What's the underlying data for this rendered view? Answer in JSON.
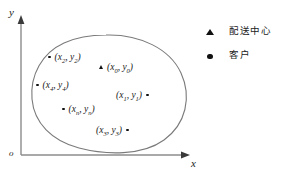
{
  "diagram": {
    "axes": {
      "y_label": "y",
      "x_label": "x",
      "origin_label": "o",
      "axis_color": "#8c8c8c"
    },
    "region": {
      "name": "service-area-boundary",
      "stroke_color": "#7a7a7a"
    },
    "points": [
      {
        "id": "point-x2-y2",
        "marker": "dot",
        "marker_side": "left",
        "var_x": "x",
        "sub_x": "2",
        "var_y": "y",
        "sub_y": "2",
        "left": 48,
        "top": 53
      },
      {
        "id": "point-x0-y0",
        "marker": "triangle",
        "marker_side": "left",
        "var_x": "x",
        "sub_x": "0",
        "var_y": "y",
        "sub_y": "0",
        "left": 99,
        "top": 63
      },
      {
        "id": "point-x4-y4",
        "marker": "dot",
        "marker_side": "left",
        "var_x": "x",
        "sub_x": "4",
        "var_y": "y",
        "sub_y": "4",
        "left": 36,
        "top": 81
      },
      {
        "id": "point-x1-y1",
        "marker": "dot",
        "marker_side": "right",
        "var_x": "x",
        "sub_x": "1",
        "var_y": "y",
        "sub_y": "1",
        "left": 116,
        "top": 91
      },
      {
        "id": "point-xn-yn",
        "marker": "dot",
        "marker_side": "left",
        "var_x": "x",
        "sub_x": "n",
        "var_y": "y",
        "sub_y": "n",
        "left": 62,
        "top": 105
      },
      {
        "id": "point-x3-y3",
        "marker": "dot",
        "marker_side": "right",
        "var_x": "x",
        "sub_x": "3",
        "var_y": "y",
        "sub_y": "3",
        "left": 96,
        "top": 126
      }
    ],
    "legend": [
      {
        "id": "legend-depot",
        "symbol": "triangle-marker",
        "label": "配送中心"
      },
      {
        "id": "legend-customer",
        "symbol": "circle-marker",
        "label": "客户"
      }
    ]
  }
}
